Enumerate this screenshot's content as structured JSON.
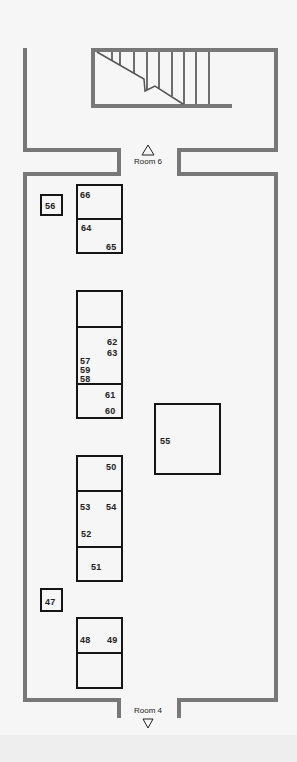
{
  "floor_plan": {
    "colors": {
      "background": "#f6f6f6",
      "wall": "#787878",
      "exhibit_outline": "#151515",
      "text": "#222222"
    },
    "exits": {
      "top": {
        "label": "Room 6",
        "arrow": "up-triangle"
      },
      "bottom": {
        "label": "Room 4",
        "arrow": "down-triangle"
      }
    },
    "stairs": {
      "label": "staircase"
    },
    "exhibits": {
      "e56": "56",
      "e66": "66",
      "e64": "64",
      "e65": "65",
      "e62": "62",
      "e63": "63",
      "e57": "57",
      "e59": "59",
      "e58": "58",
      "e61": "61",
      "e60": "60",
      "e55": "55",
      "e50": "50",
      "e53": "53",
      "e54": "54",
      "e52": "52",
      "e51": "51",
      "e47": "47",
      "e48": "48",
      "e49": "49"
    }
  }
}
